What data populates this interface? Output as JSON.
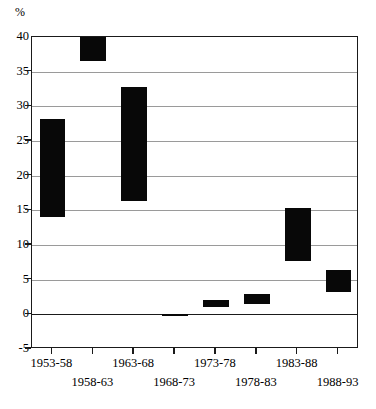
{
  "chart_data": {
    "type": "bar",
    "title": "",
    "subtitle": "",
    "xlabel": "",
    "ylabel": "%",
    "categories": [
      "1953-58",
      "1958-63",
      "1963-68",
      "1968-73",
      "1973-78",
      "1978-83",
      "1983-88",
      "1988-93"
    ],
    "values": [
      14.1,
      36.5,
      16.4,
      -0.2,
      1.0,
      1.5,
      7.7,
      3.2
    ],
    "ylim": [
      -5,
      40
    ],
    "yticks": [
      40,
      35,
      30,
      25,
      20,
      15,
      10,
      5,
      0,
      -5
    ],
    "ytick_labels": [
      "40",
      "35",
      "30",
      "25",
      "20",
      "15",
      "10",
      "5",
      "0",
      "-5"
    ],
    "grid": true,
    "grid_axis": "y",
    "legend": "none",
    "bar_color": "#080808",
    "grid_color": "#9a9a9a",
    "axis_color": "#1a1a1a",
    "background_color": "#ffffff",
    "xtick_label_stagger": true,
    "xtick_label_rows": [
      [
        "1953-58",
        "1963-68",
        "1973-78",
        "1983-88"
      ],
      [
        "1958-63",
        "1968-73",
        "1978-83",
        "1988-93"
      ]
    ]
  }
}
